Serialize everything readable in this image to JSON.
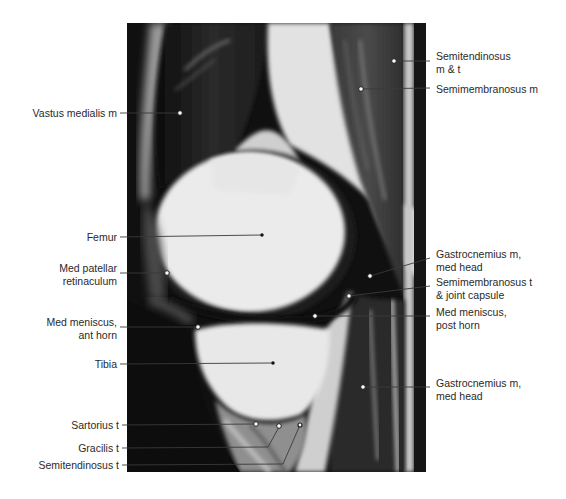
{
  "figure": {
    "type": "Sagittal MRI of knee, medial compartment",
    "labels_left": [
      {
        "id": "vastus-medialis",
        "lines": [
          "Vastus medialis m"
        ],
        "marker": "open"
      },
      {
        "id": "femur",
        "lines": [
          "Femur"
        ],
        "marker": "filled"
      },
      {
        "id": "med-patellar-retinaculum",
        "lines": [
          "Med patellar",
          "retinaculum"
        ],
        "marker": "open"
      },
      {
        "id": "med-meniscus-ant-horn",
        "lines": [
          "Med meniscus,",
          "ant horn"
        ],
        "marker": "open"
      },
      {
        "id": "tibia",
        "lines": [
          "Tibia"
        ],
        "marker": "filled"
      },
      {
        "id": "sartorius-t",
        "lines": [
          "Sartorius t"
        ],
        "marker": "open"
      },
      {
        "id": "gracilis-t",
        "lines": [
          "Gracilis t"
        ],
        "marker": "open"
      },
      {
        "id": "semitendinosus-t",
        "lines": [
          "Semitendinosus t"
        ],
        "marker": "filled"
      }
    ],
    "labels_right": [
      {
        "id": "semitendinosus-m-t",
        "lines": [
          "Semitendinosus",
          "m & t"
        ],
        "marker": "open"
      },
      {
        "id": "semimembranosus-m",
        "lines": [
          "Semimembranosus m"
        ],
        "marker": "open"
      },
      {
        "id": "gastrocnemius-med-head-upper",
        "lines": [
          "Gastrocnemius m,",
          "med head"
        ],
        "marker": "open"
      },
      {
        "id": "semimembranosus-t-joint-capsule",
        "lines": [
          "Semimembranosus t",
          "& joint capsule"
        ],
        "marker": "open"
      },
      {
        "id": "med-meniscus-post-horn",
        "lines": [
          "Med meniscus,",
          "post horn"
        ],
        "marker": "open"
      },
      {
        "id": "gastrocnemius-med-head-lower",
        "lines": [
          "Gastrocnemius m,",
          "med head"
        ],
        "marker": "open"
      }
    ],
    "colors": {
      "background": "#ffffff",
      "text": "#2a2a2a",
      "leader": "#3a3a3a",
      "tissue_dark": "#1a1a1a",
      "bone_bright": "#ececec"
    }
  }
}
